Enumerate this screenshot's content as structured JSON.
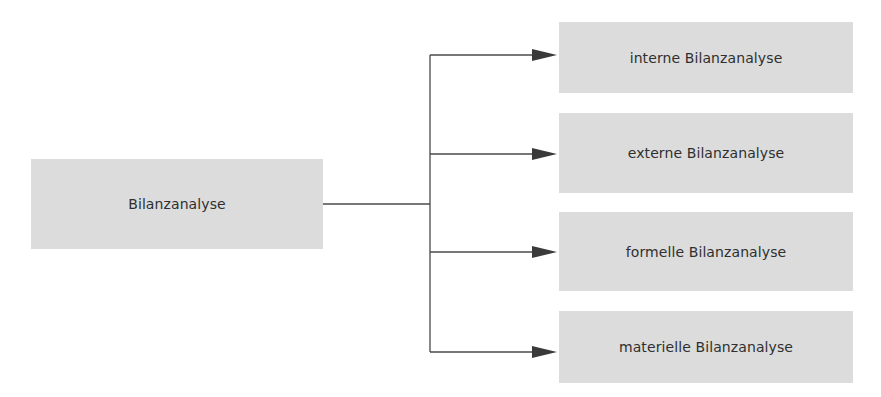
{
  "diagram": {
    "root": {
      "label": "Bilanzanalyse"
    },
    "children": [
      {
        "label": "interne Bilanzanalyse"
      },
      {
        "label": "externe Bilanzanalyse"
      },
      {
        "label": "formelle Bilanzanalyse"
      },
      {
        "label": "materielle Bilanzanalyse"
      }
    ],
    "colors": {
      "box_fill": "#dcdcdc",
      "line": "#4a4a4a",
      "text": "#2f2f2f"
    }
  }
}
